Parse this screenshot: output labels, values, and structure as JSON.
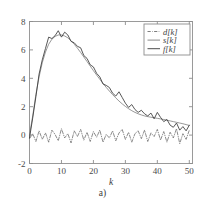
{
  "figure": {
    "caption": "a)",
    "background_color": "#ffffff",
    "frame_color": "#9a9a9a"
  },
  "chart_data": {
    "type": "line",
    "title": "",
    "subtitle": "",
    "xlabel": "k",
    "ylabel": "",
    "xlim": [
      0,
      51
    ],
    "ylim": [
      -2,
      8
    ],
    "xticks": [
      0,
      10,
      20,
      30,
      40,
      50
    ],
    "xticklabels": [
      "0",
      "10",
      "20",
      "30",
      "40",
      "50"
    ],
    "yticks": [
      -2,
      0,
      2,
      4,
      6,
      8
    ],
    "yticklabels": [
      "-2",
      "0",
      "2",
      "4",
      "6",
      "8"
    ],
    "grid": false,
    "legend_position": "upper right",
    "legend_entries": [
      {
        "label": "d[k]",
        "style": "dash-dot",
        "color": "#6f6f6f"
      },
      {
        "label": "s[k]",
        "style": "solid",
        "color": "#7d7d7d"
      },
      {
        "label": "f[k]",
        "style": "solid",
        "color": "#3a3a3a"
      }
    ],
    "x": [
      0,
      1,
      2,
      3,
      4,
      5,
      6,
      7,
      8,
      9,
      10,
      11,
      12,
      13,
      14,
      15,
      16,
      17,
      18,
      19,
      20,
      21,
      22,
      23,
      24,
      25,
      26,
      27,
      28,
      29,
      30,
      31,
      32,
      33,
      34,
      35,
      36,
      37,
      38,
      39,
      40,
      41,
      42,
      43,
      44,
      45,
      46,
      47,
      48,
      49,
      50
    ],
    "series": [
      {
        "name": "d[k]",
        "style": "dash-dot",
        "color": "#6f6f6f",
        "values": [
          -0.25,
          0.1,
          -0.45,
          0.3,
          -0.3,
          0.15,
          -0.5,
          0.35,
          0.05,
          -0.4,
          0.45,
          -0.2,
          0.1,
          -0.55,
          0.3,
          -0.1,
          0.4,
          -0.35,
          0.2,
          -0.45,
          0.25,
          -0.15,
          0.35,
          -0.5,
          0.05,
          -0.2,
          0.3,
          -0.4,
          0.15,
          0.4,
          -0.3,
          0.2,
          -0.5,
          0.1,
          0.3,
          -0.25,
          0.35,
          -0.45,
          0.15,
          -0.1,
          0.4,
          -0.35,
          0.25,
          -0.5,
          0.2,
          -0.2,
          0.45,
          -0.6,
          0.1,
          -0.3,
          0.35
        ]
      },
      {
        "name": "s[k]",
        "style": "solid",
        "color": "#7d7d7d",
        "values": [
          0.0,
          1.35,
          2.85,
          4.1,
          5.1,
          5.85,
          6.4,
          6.75,
          6.95,
          7.05,
          7.05,
          6.98,
          6.85,
          6.65,
          6.4,
          6.12,
          5.82,
          5.5,
          5.18,
          4.86,
          4.54,
          4.23,
          3.93,
          3.64,
          3.36,
          3.1,
          2.85,
          2.62,
          2.4,
          2.2,
          2.02,
          1.86,
          1.72,
          1.6,
          1.5,
          1.42,
          1.35,
          1.3,
          1.26,
          1.22,
          1.18,
          1.14,
          1.1,
          1.05,
          1.0,
          0.95,
          0.9,
          0.85,
          0.8,
          0.74,
          0.68
        ]
      },
      {
        "name": "f[k]",
        "style": "solid",
        "color": "#3a3a3a",
        "values": [
          -0.2,
          1.2,
          2.7,
          4.3,
          5.3,
          6.1,
          6.9,
          6.8,
          7.0,
          7.35,
          6.9,
          7.25,
          7.05,
          6.6,
          6.5,
          6.25,
          6.15,
          5.6,
          5.4,
          4.95,
          4.8,
          4.35,
          4.1,
          3.6,
          3.5,
          3.35,
          2.95,
          2.75,
          3.05,
          2.65,
          2.25,
          1.95,
          2.15,
          1.8,
          1.6,
          1.75,
          1.5,
          1.35,
          1.55,
          1.15,
          1.6,
          1.25,
          0.95,
          1.1,
          0.7,
          0.55,
          0.85,
          0.35,
          0.6,
          0.3,
          0.7
        ]
      }
    ]
  }
}
